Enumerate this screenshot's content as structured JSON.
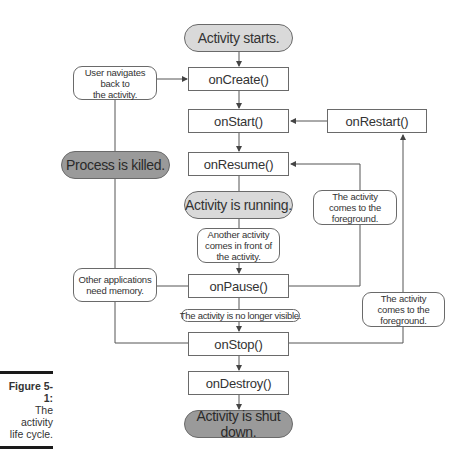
{
  "diagram": {
    "states": {
      "start": "Activity starts.",
      "running": "Activity is running.",
      "killed": "Process is killed.",
      "shutdown": "Activity is shut down."
    },
    "callbacks": {
      "onCreate": "onCreate()",
      "onStart": "onStart()",
      "onResume": "onResume()",
      "onPause": "onPause()",
      "onStop": "onStop()",
      "onDestroy": "onDestroy()",
      "onRestart": "onRestart()"
    },
    "notes": {
      "user_navigates": "User navigates\nback to\nthe activity.",
      "another_activity": "Another activity\ncomes in front of\nthe activity.",
      "other_apps": "Other applications\nneed memory.",
      "foreground_1": "The activity\ncomes to the\nforeground.",
      "foreground_2": "The activity\ncomes to the\nforeground.",
      "no_longer_visible": "The activity is no longer visible."
    },
    "colors": {
      "line": "#555555",
      "state_light": "#d9d9d9",
      "state_dark": "#9a9a9a"
    }
  },
  "caption": {
    "title": "Figure 5-1:",
    "line1": "The activity",
    "line2": "life cycle."
  }
}
